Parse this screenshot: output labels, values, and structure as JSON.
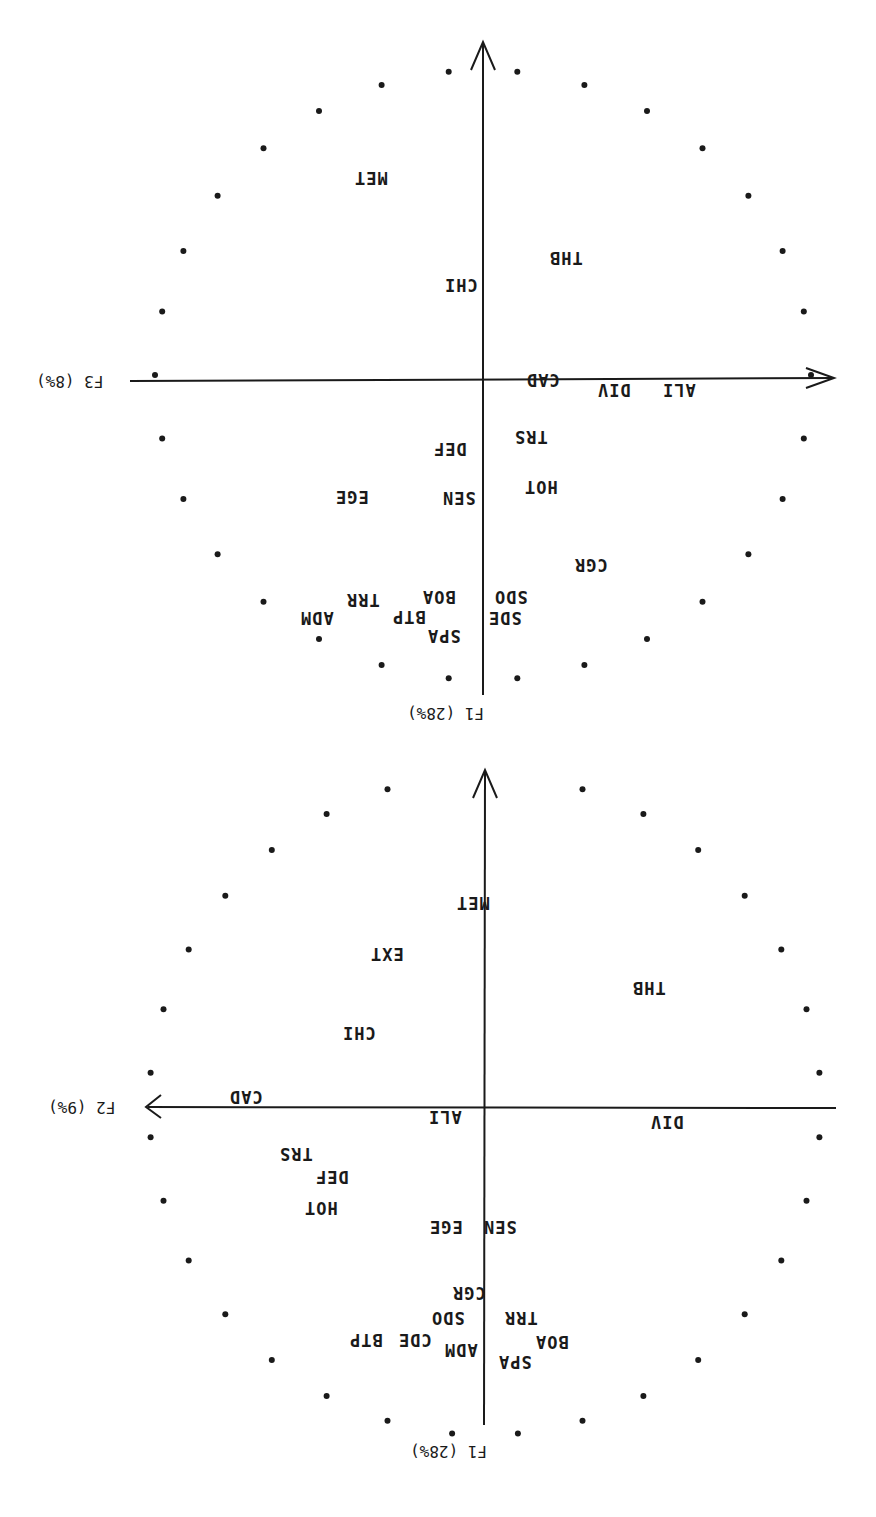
{
  "orientation": "rotated 180 degrees",
  "chart_data": [
    {
      "type": "scatter",
      "title": "Correlation circle F1 x F3",
      "xlabel": "F3 (8%)",
      "ylabel": "F1 (28%)",
      "xlim": [
        -1,
        1
      ],
      "ylim": [
        -1,
        1
      ],
      "grid": false,
      "unit_circle": "dotted",
      "points": [
        {
          "label": "MET",
          "x": -0.24,
          "y": 0.62
        },
        {
          "label": "CHI",
          "x": -0.02,
          "y": 0.27
        },
        {
          "label": "THB",
          "x": 0.28,
          "y": 0.36
        },
        {
          "label": "CAD",
          "x": 0.2,
          "y": -0.03
        },
        {
          "label": "DIV",
          "x": 0.43,
          "y": -0.08
        },
        {
          "label": "ALI",
          "x": 0.64,
          "y": -0.06
        },
        {
          "label": "TRS",
          "x": 0.21,
          "y": -0.2
        },
        {
          "label": "DEF",
          "x": -0.02,
          "y": -0.26
        },
        {
          "label": "HOT",
          "x": 0.24,
          "y": -0.38
        },
        {
          "label": "SEN",
          "x": -0.01,
          "y": -0.41
        },
        {
          "label": "EGE",
          "x": -0.3,
          "y": -0.41
        },
        {
          "label": "CGR",
          "x": 0.42,
          "y": -0.65
        },
        {
          "label": "SDO",
          "x": 0.2,
          "y": -0.74
        },
        {
          "label": "SDE",
          "x": 0.17,
          "y": -0.82
        },
        {
          "label": "BOA",
          "x": 0.0,
          "y": -0.74
        },
        {
          "label": "TRR",
          "x": -0.3,
          "y": -0.75
        },
        {
          "label": "BTP",
          "x": -0.11,
          "y": -0.8
        },
        {
          "label": "ADM",
          "x": -0.43,
          "y": -0.8
        },
        {
          "label": "SPA",
          "x": -0.03,
          "y": -0.86
        }
      ]
    },
    {
      "type": "scatter",
      "title": "Correlation circle F1 x F2",
      "xlabel": "F2 (9%)",
      "ylabel": "F1 (28%)",
      "xlim": [
        -1,
        1
      ],
      "ylim": [
        -1,
        1
      ],
      "grid": false,
      "unit_circle": "dotted",
      "points": [
        {
          "label": "MET",
          "x": 0.0,
          "y": 0.58
        },
        {
          "label": "EXT",
          "x": -0.3,
          "y": 0.4
        },
        {
          "label": "THB",
          "x": 0.5,
          "y": 0.37
        },
        {
          "label": "CHI",
          "x": -0.33,
          "y": 0.21
        },
        {
          "label": "CAD",
          "x": -0.61,
          "y": 0.0
        },
        {
          "label": "ALI",
          "x": -0.04,
          "y": -0.04
        },
        {
          "label": "DIV",
          "x": 0.56,
          "y": -0.05
        },
        {
          "label": "TRS",
          "x": -0.55,
          "y": -0.14
        },
        {
          "label": "DEF",
          "x": -0.44,
          "y": -0.2
        },
        {
          "label": "HOT",
          "x": -0.43,
          "y": -0.31
        },
        {
          "label": "EGE",
          "x": -0.04,
          "y": -0.42
        },
        {
          "label": "SEN",
          "x": 0.14,
          "y": -0.42
        },
        {
          "label": "CGR",
          "x": 0.0,
          "y": -0.6
        },
        {
          "label": "SDO",
          "x": 0.02,
          "y": -0.67
        },
        {
          "label": "TRR",
          "x": 0.26,
          "y": -0.67
        },
        {
          "label": "CDE",
          "x": -0.2,
          "y": -0.74
        },
        {
          "label": "BTP",
          "x": -0.43,
          "y": -0.74
        },
        {
          "label": "ADM",
          "x": 0.08,
          "y": -0.75
        },
        {
          "label": "BOA",
          "x": 0.35,
          "y": -0.74
        },
        {
          "label": "SPA",
          "x": 0.17,
          "y": -0.8
        }
      ]
    }
  ],
  "top_plot": {
    "x_axis_label": "F3 (8%)",
    "y_axis_label": "F1 (28%)",
    "labels": [
      {
        "t": "MET",
        "x": 372,
        "y": 178
      },
      {
        "t": "CHI",
        "x": 462,
        "y": 285
      },
      {
        "t": "THB",
        "x": 567,
        "y": 258
      },
      {
        "t": "CAD",
        "x": 544,
        "y": 380
      },
      {
        "t": "DIV",
        "x": 615,
        "y": 390
      },
      {
        "t": "ALI",
        "x": 680,
        "y": 390
      },
      {
        "t": "TRS",
        "x": 532,
        "y": 437
      },
      {
        "t": "DEF",
        "x": 451,
        "y": 449
      },
      {
        "t": "HOT",
        "x": 542,
        "y": 487
      },
      {
        "t": "SEN",
        "x": 460,
        "y": 498
      },
      {
        "t": "EGE",
        "x": 353,
        "y": 497
      },
      {
        "t": "CGR",
        "x": 592,
        "y": 565
      },
      {
        "t": "SDO",
        "x": 512,
        "y": 597
      },
      {
        "t": "SDE",
        "x": 506,
        "y": 618
      },
      {
        "t": "BOA",
        "x": 440,
        "y": 597
      },
      {
        "t": "TRR",
        "x": 364,
        "y": 600
      },
      {
        "t": "BTP",
        "x": 410,
        "y": 617
      },
      {
        "t": "ADM",
        "x": 318,
        "y": 618
      },
      {
        "t": "SPA",
        "x": 445,
        "y": 636
      }
    ]
  },
  "bottom_plot": {
    "x_axis_label": "F2 (9%)",
    "y_axis_label": "F1 (28%)",
    "labels": [
      {
        "t": "MET",
        "x": 474,
        "y": 903
      },
      {
        "t": "EXT",
        "x": 388,
        "y": 954
      },
      {
        "t": "THB",
        "x": 650,
        "y": 988
      },
      {
        "t": "CHI",
        "x": 360,
        "y": 1033
      },
      {
        "t": "CAD",
        "x": 247,
        "y": 1097
      },
      {
        "t": "ALI",
        "x": 446,
        "y": 1117
      },
      {
        "t": "DIV",
        "x": 668,
        "y": 1122
      },
      {
        "t": "TRS",
        "x": 297,
        "y": 1154
      },
      {
        "t": "DEF",
        "x": 333,
        "y": 1177
      },
      {
        "t": "HOT",
        "x": 322,
        "y": 1208
      },
      {
        "t": "EGE",
        "x": 447,
        "y": 1227
      },
      {
        "t": "SEN",
        "x": 501,
        "y": 1227
      },
      {
        "t": "CGR",
        "x": 470,
        "y": 1293
      },
      {
        "t": "SDO",
        "x": 449,
        "y": 1318
      },
      {
        "t": "TRR",
        "x": 522,
        "y": 1318
      },
      {
        "t": "CDE",
        "x": 416,
        "y": 1340
      },
      {
        "t": "BTP",
        "x": 367,
        "y": 1340
      },
      {
        "t": "ADM",
        "x": 462,
        "y": 1350
      },
      {
        "t": "BOA",
        "x": 553,
        "y": 1342
      },
      {
        "t": "SPA",
        "x": 516,
        "y": 1362
      }
    ]
  }
}
